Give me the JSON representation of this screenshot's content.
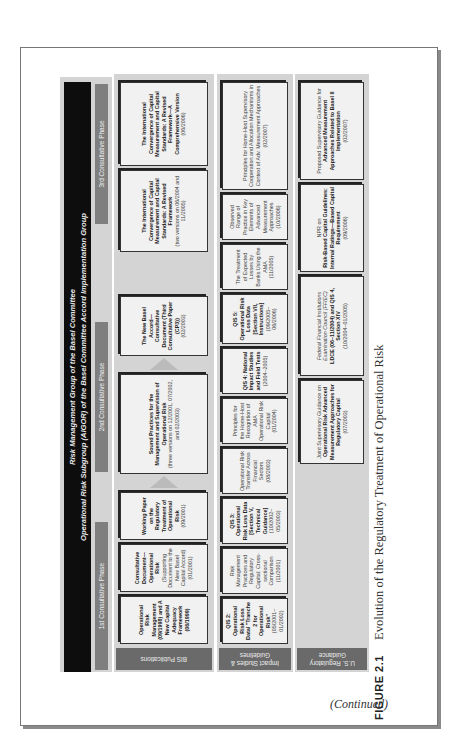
{
  "figure": {
    "header": {
      "line1": "Risk Management Group of the Basel Committee",
      "line2": "Operational Risk Subgroup (AIGOR) of the Basel Committee Accord Implementation Group"
    },
    "phases": [
      "1st Consultative Phase",
      "2nd Consultative Phase",
      "3rd Consultative Phase"
    ],
    "row_labels": [
      "BIS Publications",
      "Impact Studies & Guidelines",
      "U.S. Regulatory Guidance"
    ],
    "bis_publications": [
      {
        "title": "Operational Risk Management (09/1998) and A New Capital Adequacy Framework (06/1999)"
      },
      {
        "title": "Consultative Document—Operational Risk",
        "note": "(Supporting Document to the New Basel Capital Accord) (01/2001)"
      },
      {
        "title": "Working Paper on the Regulatory Treatment of Operational Risk",
        "note": "(09/2001)"
      },
      {
        "title": "Sound Practices for the Management and Supervision of Operational Risk",
        "note": "(three versions on 12/2001, 07/2002, and 02/2003)"
      },
      {
        "title": "The New Basel Accord—Consultative Document (Third Consultative Paper (CP3))",
        "note": "(02/2003)"
      },
      {
        "title": "The International Convergence of Capital Measurement and Capital Standards: A Revised Framework",
        "note": "(two versions on 06/2004 and 11/2005)"
      },
      {
        "title": "The International Convergence of Capital Measurement and Capital Standards: A Revised Framework—A Comprehensive Version",
        "note": "(06/2006)"
      }
    ],
    "impact_studies": [
      {
        "title": "QIS 2: Operational Risk Loss Data/ \"Tranche 2 for Operational Risk\"",
        "note": "(05/2001–01/2002)"
      },
      {
        "title": "Risk Management Practices and Regulatory Capital: Cross-sectional Comparison",
        "note": "(11/2001)"
      },
      {
        "title": "QIS 3: Operational Risk Loss Data [Section V, Technical Guidance]",
        "note": "(10/2002–05/2003)"
      },
      {
        "title": "Operational Risk Transfer Across Financial Sectors",
        "note": "(08/2003)"
      },
      {
        "title": "Principles for the Home-Host Recognition of AMA Operational Risk Capital",
        "note": "(01/2004)"
      },
      {
        "title": "QIS 4: National Impact Studies and Field Tests",
        "note": "(2004–2005)"
      },
      {
        "title": "QIS 5: Operational Risk Loss Data [Section VII, Instructions]",
        "note": "(09/2005–06/2006)"
      },
      {
        "title": "The Treatment of Expected Losses by Banks Using the AMA",
        "note": "(11/2005)"
      },
      {
        "title": "Observed Range of Practice in Key Elements of Advanced Measurement Approaches",
        "note": "(10/2006)"
      },
      {
        "title": "Principles for Home-Host Supervisory Cooperation and Allocation Mechanisms in Context of Adv. Measurement Approaches",
        "note": "(02/2007)"
      }
    ],
    "us_guidance": [
      {
        "pre": "Joint Supervisory Guidance on",
        "title": "Operational Risk Advanced Measurement Approaches for Regulatory Capital",
        "note": "(07/2003)"
      },
      {
        "pre": "Federal Financial Institutions Examination Council (FFIEC)",
        "title": "LDCE (06–11/2004) and QIS 4, Section XIV",
        "note": "(10/2004–01/2005)"
      },
      {
        "pre": "NPR on",
        "title": "Risk-Based Capital Guidelines: Internal Ratings—Based Capital Requirement",
        "note": "(09/2006)"
      },
      {
        "pre": "Proposed Supervisory Guidance for",
        "title": "Advanced Measurement Approaches Related to Basel II Implementation",
        "note": "(02/2007)"
      }
    ]
  },
  "caption": {
    "figure_number": "FIGURE 2.1",
    "text": "Evolution of the Regulatory Treatment of Operational Risk"
  },
  "continued": "(Continued)"
}
